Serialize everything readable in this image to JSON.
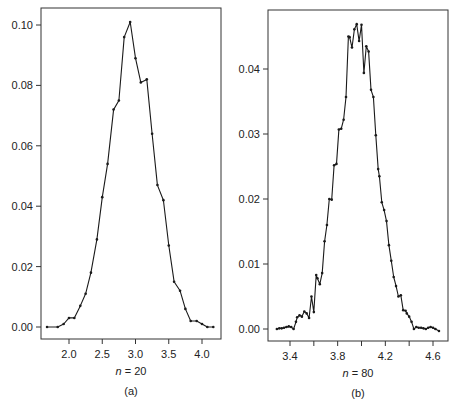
{
  "figure": {
    "panels": [
      {
        "caption_letter": "(a)",
        "n_label_var": "n",
        "n_label_rest": " = 20"
      },
      {
        "caption_letter": "(b)",
        "n_label_var": "n",
        "n_label_rest": " = 80"
      }
    ],
    "line_color": "#1a1a1a",
    "frame_color": "#333333"
  },
  "chart_data": [
    {
      "type": "line",
      "title": "",
      "xlabel": "n = 20",
      "ylabel": "",
      "caption": "(a)",
      "xlim": [
        1.6,
        4.25
      ],
      "ylim": [
        -0.004,
        0.106
      ],
      "grid": false,
      "xticks": [
        2.0,
        2.5,
        3.0,
        3.5,
        4.0
      ],
      "xtick_labels": [
        "2.0",
        "2.5",
        "3.0",
        "3.5",
        "4.0"
      ],
      "yticks": [
        0.0,
        0.02,
        0.04,
        0.06,
        0.08,
        0.1
      ],
      "ytick_labels": [
        "0.00",
        "0.02",
        "0.04",
        "0.06",
        "0.08",
        "0.10"
      ],
      "series": [
        {
          "name": "n=20",
          "x": [
            1.67,
            1.83,
            1.92,
            2.0,
            2.08,
            2.17,
            2.25,
            2.33,
            2.42,
            2.5,
            2.58,
            2.67,
            2.75,
            2.83,
            2.92,
            3.0,
            3.08,
            3.17,
            3.25,
            3.33,
            3.42,
            3.5,
            3.58,
            3.67,
            3.75,
            3.83,
            3.92,
            4.0,
            4.08,
            4.17
          ],
          "y": [
            0.0,
            0.0,
            0.001,
            0.003,
            0.003,
            0.007,
            0.011,
            0.018,
            0.029,
            0.043,
            0.054,
            0.072,
            0.075,
            0.096,
            0.101,
            0.089,
            0.081,
            0.082,
            0.064,
            0.047,
            0.042,
            0.027,
            0.015,
            0.012,
            0.006,
            0.002,
            0.002,
            0.001,
            0.0,
            0.0
          ]
        }
      ]
    },
    {
      "type": "line",
      "title": "",
      "xlabel": "n = 80",
      "ylabel": "",
      "caption": "(b)",
      "xlim": [
        3.25,
        4.7
      ],
      "ylim": [
        -0.0018,
        0.0485
      ],
      "grid": false,
      "xticks": [
        3.4,
        3.6,
        3.8,
        4.0,
        4.2,
        4.4,
        4.6
      ],
      "xtick_labels": [
        "3.4",
        "",
        "3.8",
        "",
        "4.2",
        "",
        "4.6"
      ],
      "yticks": [
        0.0,
        0.01,
        0.02,
        0.03,
        0.04
      ],
      "ytick_labels": [
        "0.00",
        "0.01",
        "0.02",
        "0.03",
        "0.04"
      ],
      "series": [
        {
          "name": "n=80",
          "x": [
            3.29,
            3.31,
            3.33,
            3.35,
            3.37,
            3.39,
            3.41,
            3.43,
            3.45,
            3.46,
            3.48,
            3.5,
            3.52,
            3.54,
            3.56,
            3.58,
            3.6,
            3.62,
            3.63,
            3.65,
            3.67,
            3.69,
            3.71,
            3.73,
            3.75,
            3.77,
            3.79,
            3.81,
            3.83,
            3.85,
            3.87,
            3.89,
            3.9,
            3.92,
            3.94,
            3.96,
            3.98,
            4.0,
            4.02,
            4.04,
            4.06,
            4.08,
            4.1,
            4.12,
            4.14,
            4.15,
            4.17,
            4.19,
            4.21,
            4.23,
            4.25,
            4.27,
            4.29,
            4.31,
            4.33,
            4.35,
            4.37,
            4.38,
            4.4,
            4.42,
            4.44,
            4.46,
            4.48,
            4.5,
            4.52,
            4.54,
            4.56,
            4.58,
            4.6,
            4.62,
            4.65
          ],
          "y": [
            0.0,
            0.0001,
            0.0001,
            0.0002,
            0.0003,
            0.0004,
            0.0003,
            0.0,
            0.0011,
            0.0018,
            0.0021,
            0.0019,
            0.0027,
            0.0024,
            0.0017,
            0.005,
            0.0026,
            0.0083,
            0.0078,
            0.0069,
            0.0086,
            0.0135,
            0.016,
            0.02,
            0.0199,
            0.0252,
            0.0254,
            0.0307,
            0.0308,
            0.0322,
            0.0357,
            0.045,
            0.0449,
            0.0433,
            0.0461,
            0.0469,
            0.0443,
            0.0468,
            0.0394,
            0.0435,
            0.0427,
            0.0368,
            0.0357,
            0.0298,
            0.0246,
            0.0235,
            0.0195,
            0.0183,
            0.0166,
            0.0129,
            0.0105,
            0.008,
            0.0066,
            0.005,
            0.0052,
            0.0029,
            0.0028,
            0.0024,
            0.0019,
            0.0011,
            0.0,
            0.0003,
            0.0002,
            0.0002,
            0.0001,
            0.0,
            0.0002,
            0.0003,
            0.0002,
            0.0,
            -0.0003
          ]
        }
      ]
    }
  ]
}
